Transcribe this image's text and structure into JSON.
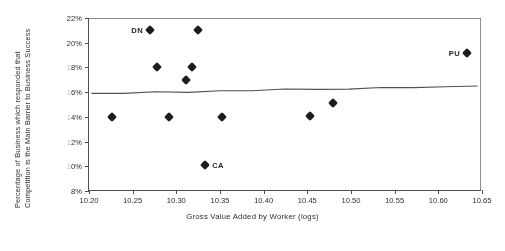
{
  "chart_data": {
    "type": "scatter",
    "title": "",
    "xlabel": "Gross Value Added by Worker (logs)",
    "ylabel_line1": "Percentage of Business which responded that",
    "ylabel_line2": "Competition is the Main Barrier to Business Success",
    "xlim": [
      10.2,
      10.65
    ],
    "ylim": [
      8,
      22
    ],
    "xticks": [
      "10.20",
      "10.25",
      "10.30",
      "10.35",
      "10.40",
      "10.45",
      "10.50",
      "10.55",
      "10.60",
      "10.65"
    ],
    "xtick_values": [
      10.2,
      10.25,
      10.3,
      10.35,
      10.4,
      10.45,
      10.5,
      10.55,
      10.6,
      10.65
    ],
    "yticks": [
      "22%",
      "20%",
      "18%",
      "16%",
      "14%",
      "12%",
      "10%",
      "8%"
    ],
    "ytick_values": [
      22,
      20,
      18,
      16,
      14,
      12,
      10,
      8
    ],
    "grid": false,
    "legend": "none",
    "marker_shape": "filled-diamond",
    "marker_color": "#141414",
    "trendline": {
      "visible": true,
      "color": "#4a4a4a",
      "x_start": 10.2027,
      "y_start": 15.9,
      "x_end": 10.645,
      "y_end": 16.5
    },
    "points": [
      {
        "x": 10.2265,
        "y": 14.0,
        "label": ""
      },
      {
        "x": 10.27,
        "y": 21.0,
        "label": "DN",
        "label_side": "left"
      },
      {
        "x": 10.278,
        "y": 18.0,
        "label": ""
      },
      {
        "x": 10.2915,
        "y": 14.0,
        "label": ""
      },
      {
        "x": 10.311,
        "y": 17.0,
        "label": ""
      },
      {
        "x": 10.318,
        "y": 18.0,
        "label": ""
      },
      {
        "x": 10.3245,
        "y": 21.0,
        "label": ""
      },
      {
        "x": 10.333,
        "y": 10.1,
        "label": "CA",
        "label_side": "right"
      },
      {
        "x": 10.352,
        "y": 14.0,
        "label": ""
      },
      {
        "x": 10.4525,
        "y": 14.1,
        "label": ""
      },
      {
        "x": 10.479,
        "y": 15.1,
        "label": ""
      },
      {
        "x": 10.633,
        "y": 19.2,
        "label": "PU",
        "label_side": "left"
      }
    ]
  }
}
